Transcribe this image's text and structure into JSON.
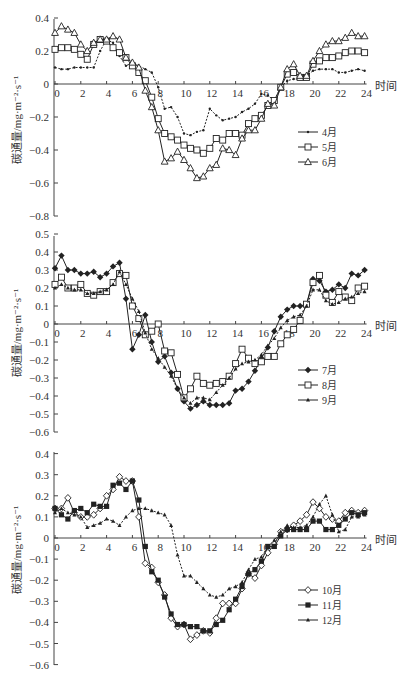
{
  "chart_data": [
    {
      "type": "line",
      "title": "",
      "xlabel": "时间",
      "ylabel": "碳通量/mg·m⁻²·s⁻¹",
      "ylim": [
        -0.8,
        0.4
      ],
      "xlim": [
        0,
        24
      ],
      "yticks": [
        0.4,
        0.2,
        0,
        -0.2,
        -0.4,
        -0.6,
        -0.8
      ],
      "xticks": [
        0,
        2,
        4,
        6,
        8,
        10,
        12,
        14,
        16,
        18,
        20,
        22,
        24
      ],
      "legend_position": "right-middle",
      "grid": false,
      "x": [
        0,
        0.5,
        1,
        1.5,
        2,
        2.5,
        3,
        3.5,
        4,
        4.5,
        5,
        5.5,
        6,
        6.5,
        7,
        7.5,
        8,
        8.5,
        9,
        9.5,
        10,
        10.5,
        11,
        11.5,
        12,
        12.5,
        13,
        13.5,
        14,
        14.5,
        15,
        15.5,
        16,
        16.5,
        17,
        17.5,
        18,
        18.5,
        19,
        19.5,
        20,
        20.5,
        21,
        21.5,
        22,
        22.5,
        23,
        23.5,
        24
      ],
      "series": [
        {
          "name": "4月",
          "marker": "dot",
          "values": [
            0.1,
            0.09,
            0.09,
            0.1,
            0.1,
            0.1,
            0.1,
            0.2,
            0.27,
            0.25,
            0.17,
            0.11,
            0.13,
            0.11,
            0.09,
            0.07,
            -0.02,
            -0.15,
            -0.14,
            -0.2,
            -0.3,
            -0.31,
            -0.29,
            -0.28,
            -0.15,
            -0.19,
            -0.22,
            -0.21,
            -0.2,
            -0.17,
            -0.15,
            -0.12,
            -0.06,
            -0.07,
            -0.1,
            -0.02,
            0.02,
            0.03,
            0.03,
            0.05,
            0.08,
            0.09,
            0.09,
            0.09,
            0.07,
            0.07,
            0.08,
            0.09,
            0.08
          ]
        },
        {
          "name": "5月",
          "marker": "open-square",
          "values": [
            0.21,
            0.22,
            0.22,
            0.21,
            0.18,
            0.15,
            0.24,
            0.27,
            0.26,
            0.22,
            0.19,
            0.16,
            0.11,
            0.07,
            0.02,
            -0.08,
            -0.21,
            -0.3,
            -0.32,
            -0.34,
            -0.37,
            -0.39,
            -0.4,
            -0.42,
            -0.39,
            -0.33,
            -0.34,
            -0.3,
            -0.3,
            -0.31,
            -0.24,
            -0.21,
            -0.19,
            -0.13,
            -0.1,
            -0.02,
            0.06,
            0.07,
            0.04,
            0.04,
            0.12,
            0.14,
            0.16,
            0.16,
            0.17,
            0.19,
            0.2,
            0.2,
            0.19
          ]
        },
        {
          "name": "6月",
          "marker": "open-triangle",
          "values": [
            0.31,
            0.35,
            0.33,
            0.31,
            0.24,
            0.2,
            0.25,
            0.27,
            0.27,
            0.29,
            0.27,
            0.16,
            0.13,
            0.1,
            -0.04,
            -0.14,
            -0.28,
            -0.47,
            -0.45,
            -0.41,
            -0.46,
            -0.51,
            -0.57,
            -0.56,
            -0.51,
            -0.49,
            -0.39,
            -0.4,
            -0.43,
            -0.33,
            -0.28,
            -0.28,
            -0.21,
            -0.12,
            -0.13,
            -0.02,
            0.09,
            0.12,
            0.05,
            0.05,
            0.14,
            0.2,
            0.24,
            0.26,
            0.26,
            0.28,
            0.31,
            0.29,
            0.29
          ]
        }
      ]
    },
    {
      "type": "line",
      "title": "",
      "xlabel": "时间",
      "ylabel": "碳通量/mg·m⁻²·s⁻¹",
      "ylim": [
        -0.6,
        0.5
      ],
      "xlim": [
        0,
        24
      ],
      "yticks": [
        0.5,
        0.4,
        0.3,
        0.2,
        0.1,
        0,
        -0.1,
        -0.2,
        -0.3,
        -0.4,
        -0.5,
        -0.6
      ],
      "xticks": [
        0,
        2,
        4,
        6,
        8,
        10,
        12,
        14,
        16,
        18,
        20,
        22,
        24
      ],
      "legend_position": "right-middle",
      "grid": false,
      "x": [
        0,
        0.5,
        1,
        1.5,
        2,
        2.5,
        3,
        3.5,
        4,
        4.5,
        5,
        5.5,
        6,
        6.5,
        7,
        7.5,
        8,
        8.5,
        9,
        9.5,
        10,
        10.5,
        11,
        11.5,
        12,
        12.5,
        13,
        13.5,
        14,
        14.5,
        15,
        15.5,
        16,
        16.5,
        17,
        17.5,
        18,
        18.5,
        19,
        19.5,
        20,
        20.5,
        21,
        21.5,
        22,
        22.5,
        23,
        23.5,
        24
      ],
      "series": [
        {
          "name": "7月",
          "marker": "filled-diamond",
          "values": [
            0.31,
            0.38,
            0.3,
            0.3,
            0.28,
            0.28,
            0.29,
            0.26,
            0.28,
            0.32,
            0.34,
            0.14,
            -0.14,
            -0.06,
            0.05,
            -0.1,
            -0.21,
            -0.18,
            -0.27,
            -0.36,
            -0.43,
            -0.47,
            -0.45,
            -0.43,
            -0.45,
            -0.45,
            -0.45,
            -0.44,
            -0.37,
            -0.36,
            -0.32,
            -0.26,
            -0.19,
            -0.13,
            -0.04,
            0.04,
            0.08,
            0.1,
            0.1,
            0.11,
            0.25,
            0.24,
            0.18,
            0.19,
            0.22,
            0.2,
            0.28,
            0.27,
            0.3
          ]
        },
        {
          "name": "8月",
          "marker": "open-square",
          "values": [
            0.22,
            0.26,
            0.2,
            0.2,
            0.22,
            0.17,
            0.16,
            0.18,
            0.18,
            0.23,
            0.28,
            0.27,
            0.1,
            0.03,
            -0.06,
            -0.04,
            0.0,
            -0.15,
            -0.16,
            -0.28,
            -0.41,
            -0.36,
            -0.29,
            -0.33,
            -0.34,
            -0.33,
            -0.32,
            -0.29,
            -0.22,
            -0.14,
            -0.19,
            -0.22,
            -0.21,
            -0.18,
            -0.18,
            -0.11,
            -0.06,
            -0.03,
            0.02,
            0.11,
            0.23,
            0.27,
            0.16,
            0.12,
            0.18,
            0.15,
            0.13,
            0.2,
            0.21
          ]
        },
        {
          "name": "9月",
          "marker": "filled-triangle",
          "values": [
            0.2,
            0.22,
            0.2,
            0.19,
            0.19,
            0.17,
            0.17,
            0.18,
            0.19,
            0.22,
            0.29,
            0.22,
            0.14,
            0.07,
            -0.05,
            -0.14,
            -0.19,
            -0.24,
            -0.29,
            -0.36,
            -0.41,
            -0.44,
            -0.41,
            -0.41,
            -0.42,
            -0.38,
            -0.34,
            -0.3,
            -0.25,
            -0.22,
            -0.21,
            -0.2,
            -0.17,
            -0.12,
            -0.08,
            -0.02,
            0.02,
            0.04,
            0.05,
            0.1,
            0.19,
            0.19,
            0.13,
            0.11,
            0.12,
            0.14,
            0.15,
            0.17,
            0.18
          ]
        }
      ]
    },
    {
      "type": "line",
      "title": "",
      "xlabel": "时间",
      "ylabel": "碳通量/mg·m⁻²·s⁻¹",
      "ylim": [
        -0.6,
        0.4
      ],
      "xlim": [
        0,
        24
      ],
      "yticks": [
        0.4,
        0.3,
        0.2,
        0.1,
        0,
        -0.1,
        -0.2,
        -0.3,
        -0.4,
        -0.5,
        -0.6
      ],
      "xticks": [
        0,
        2,
        4,
        6,
        8,
        10,
        12,
        14,
        16,
        18,
        20,
        22,
        24
      ],
      "legend_position": "right-middle",
      "grid": false,
      "x": [
        0,
        0.5,
        1,
        1.5,
        2,
        2.5,
        3,
        3.5,
        4,
        4.5,
        5,
        5.5,
        6,
        6.5,
        7,
        7.5,
        8,
        8.5,
        9,
        9.5,
        10,
        10.5,
        11,
        11.5,
        12,
        12.5,
        13,
        13.5,
        14,
        14.5,
        15,
        15.5,
        16,
        16.5,
        17,
        17.5,
        18,
        18.5,
        19,
        19.5,
        20,
        20.5,
        21,
        21.5,
        22,
        22.5,
        23,
        23.5,
        24
      ],
      "series": [
        {
          "name": "10月",
          "marker": "open-diamond",
          "values": [
            0.14,
            0.14,
            0.19,
            0.12,
            0.1,
            0.1,
            0.11,
            0.14,
            0.2,
            0.23,
            0.29,
            0.27,
            0.27,
            0.1,
            -0.12,
            -0.14,
            -0.21,
            -0.27,
            -0.38,
            -0.42,
            -0.41,
            -0.48,
            -0.46,
            -0.44,
            -0.45,
            -0.38,
            -0.31,
            -0.31,
            -0.31,
            -0.24,
            -0.17,
            -0.19,
            -0.13,
            -0.07,
            -0.03,
            0.03,
            0.04,
            0.06,
            0.08,
            0.11,
            0.17,
            0.14,
            0.1,
            0.09,
            0.08,
            0.12,
            0.13,
            0.12,
            0.13
          ]
        },
        {
          "name": "11月",
          "marker": "filled-square",
          "values": [
            0.14,
            0.11,
            0.09,
            0.13,
            0.14,
            0.12,
            0.16,
            0.15,
            0.15,
            0.25,
            0.26,
            0.23,
            0.27,
            0.18,
            -0.04,
            -0.16,
            -0.2,
            -0.28,
            -0.36,
            -0.41,
            -0.41,
            -0.42,
            -0.42,
            -0.44,
            -0.44,
            -0.41,
            -0.39,
            -0.34,
            -0.29,
            -0.23,
            -0.17,
            -0.15,
            -0.11,
            -0.04,
            -0.04,
            0.01,
            0.04,
            0.04,
            0.04,
            0.04,
            0.08,
            0.08,
            0.04,
            0.04,
            0.06,
            0.09,
            0.12,
            0.11,
            0.12
          ]
        },
        {
          "name": "12月",
          "marker": "filled-triangle",
          "values": [
            0.12,
            0.14,
            0.12,
            0.11,
            0.1,
            0.05,
            0.06,
            0.07,
            0.09,
            0.08,
            0.06,
            0.1,
            0.13,
            0.14,
            0.14,
            0.13,
            0.12,
            0.11,
            0.06,
            -0.08,
            -0.18,
            -0.18,
            -0.21,
            -0.24,
            -0.27,
            -0.28,
            -0.27,
            -0.24,
            -0.23,
            -0.21,
            -0.15,
            -0.1,
            -0.09,
            -0.04,
            -0.01,
            0.03,
            0.06,
            0.05,
            0.05,
            0.06,
            0.1,
            0.16,
            0.2,
            0.11,
            0.03,
            0.04,
            0.1,
            0.1,
            0.11
          ]
        }
      ]
    }
  ],
  "axes_common": {
    "x_title": "时间",
    "y_title": "碳通量/mg·m⁻²·s⁻¹"
  }
}
